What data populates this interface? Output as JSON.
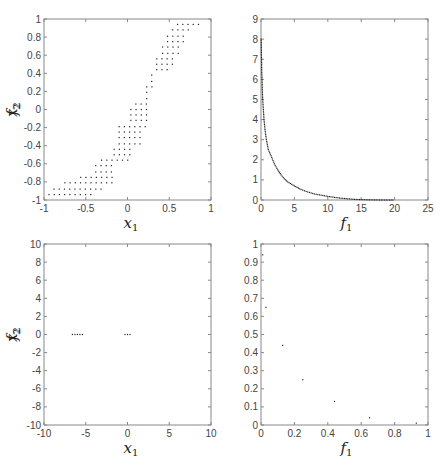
{
  "chart_data": [
    {
      "id": "decision-space-top",
      "type": "scatter",
      "xlabel": "x1",
      "ylabel": "x2",
      "xlim": [
        -1,
        1
      ],
      "ylim": [
        -1,
        1
      ],
      "xticks": [
        -1,
        -0.5,
        0,
        0.5,
        1
      ],
      "yticks": [
        -1,
        -0.8,
        -0.6,
        -0.4,
        -0.2,
        0,
        0.2,
        0.4,
        0.6,
        0.8,
        1
      ],
      "xtick_labels": [
        "-1",
        "-0.5",
        "0",
        "0.5",
        "1"
      ],
      "ytick_labels": [
        "-1",
        "-0.8",
        "-0.6",
        "-0.4",
        "-0.2",
        "0",
        "0.2",
        "0.4",
        "0.6",
        "0.8",
        "1"
      ],
      "grid": false,
      "frame": {
        "x0": 44,
        "y0": 19,
        "x1": 211,
        "y1": 200
      },
      "bands": [
        {
          "y": -0.94,
          "x_from": -0.94,
          "x_to": -0.38
        },
        {
          "y": -0.88,
          "x_from": -0.88,
          "x_to": -0.31
        },
        {
          "y": -0.81,
          "x_from": -0.75,
          "x_to": -0.16
        },
        {
          "y": -0.75,
          "x_from": -0.56,
          "x_to": -0.16
        },
        {
          "y": -0.69,
          "x_from": -0.38,
          "x_to": -0.16
        },
        {
          "y": -0.62,
          "x_from": -0.38,
          "x_to": -0.16
        },
        {
          "y": -0.56,
          "x_from": -0.31,
          "x_to": 0.06
        },
        {
          "y": -0.5,
          "x_from": -0.16,
          "x_to": 0.06
        },
        {
          "y": -0.44,
          "x_from": -0.16,
          "x_to": 0.06
        },
        {
          "y": -0.38,
          "x_from": -0.1,
          "x_to": 0.19
        },
        {
          "y": -0.31,
          "x_from": -0.1,
          "x_to": 0.19
        },
        {
          "y": -0.25,
          "x_from": -0.1,
          "x_to": 0.19
        },
        {
          "y": -0.19,
          "x_from": -0.1,
          "x_to": 0.25
        },
        {
          "y": -0.12,
          "x_from": 0.04,
          "x_to": 0.25
        },
        {
          "y": -0.06,
          "x_from": 0.04,
          "x_to": 0.25
        },
        {
          "y": 0.0,
          "x_from": 0.04,
          "x_to": 0.25
        },
        {
          "y": 0.06,
          "x_from": 0.1,
          "x_to": 0.25
        },
        {
          "y": 0.12,
          "x_from": 0.23,
          "x_to": 0.29
        },
        {
          "y": 0.19,
          "x_from": 0.23,
          "x_to": 0.29
        },
        {
          "y": 0.25,
          "x_from": 0.23,
          "x_to": 0.35
        },
        {
          "y": 0.31,
          "x_from": 0.29,
          "x_to": 0.35
        },
        {
          "y": 0.38,
          "x_from": 0.29,
          "x_to": 0.35
        },
        {
          "y": 0.44,
          "x_from": 0.35,
          "x_to": 0.48
        },
        {
          "y": 0.5,
          "x_from": 0.35,
          "x_to": 0.54
        },
        {
          "y": 0.56,
          "x_from": 0.35,
          "x_to": 0.54
        },
        {
          "y": 0.62,
          "x_from": 0.42,
          "x_to": 0.62
        },
        {
          "y": 0.69,
          "x_from": 0.42,
          "x_to": 0.62
        },
        {
          "y": 0.75,
          "x_from": 0.48,
          "x_to": 0.67
        },
        {
          "y": 0.81,
          "x_from": 0.48,
          "x_to": 0.67
        },
        {
          "y": 0.88,
          "x_from": 0.54,
          "x_to": 0.73
        },
        {
          "y": 0.94,
          "x_from": 0.6,
          "x_to": 0.88
        }
      ],
      "grid_step": 0.0625
    },
    {
      "id": "objective-space-top",
      "type": "scatter",
      "xlabel": "f1",
      "ylabel": "f2",
      "xlim": [
        0,
        25
      ],
      "ylim": [
        0,
        9
      ],
      "xticks": [
        0,
        5,
        10,
        15,
        20,
        25
      ],
      "yticks": [
        0,
        1,
        2,
        3,
        4,
        5,
        6,
        7,
        8,
        9
      ],
      "xtick_labels": [
        "0",
        "5",
        "10",
        "15",
        "20",
        "25"
      ],
      "ytick_labels": [
        "0",
        "1",
        "2",
        "3",
        "4",
        "5",
        "6",
        "7",
        "8",
        "9"
      ],
      "grid": false,
      "frame": {
        "x0": 261,
        "y0": 19,
        "x1": 428,
        "y1": 200
      },
      "curve_description": "dense Pareto front, roughly f2 decreasing from ~8 at f1~0 to ~0 at f1~20",
      "points": [
        [
          0.02,
          8.0
        ],
        [
          0.05,
          7.5
        ],
        [
          0.08,
          7.0
        ],
        [
          0.1,
          6.5
        ],
        [
          0.15,
          6.0
        ],
        [
          0.2,
          5.5
        ],
        [
          0.25,
          5.0
        ],
        [
          0.35,
          4.5
        ],
        [
          0.45,
          4.0
        ],
        [
          0.6,
          3.5
        ],
        [
          0.8,
          3.0
        ],
        [
          1.1,
          2.5
        ],
        [
          1.5,
          2.2
        ],
        [
          2.0,
          1.8
        ],
        [
          2.5,
          1.5
        ],
        [
          3.0,
          1.25
        ],
        [
          3.5,
          1.05
        ],
        [
          4.0,
          0.9
        ],
        [
          5.0,
          0.7
        ],
        [
          6.0,
          0.52
        ],
        [
          7.0,
          0.4
        ],
        [
          8.0,
          0.3
        ],
        [
          9.0,
          0.24
        ],
        [
          10.0,
          0.18
        ],
        [
          11.0,
          0.13
        ],
        [
          12.0,
          0.09
        ],
        [
          13.0,
          0.06
        ],
        [
          14.0,
          0.03
        ],
        [
          15.0,
          0.02
        ],
        [
          16.0,
          0.01
        ],
        [
          18.0,
          0.0
        ],
        [
          20.0,
          0.0
        ]
      ]
    },
    {
      "id": "decision-space-bottom",
      "type": "scatter",
      "xlabel": "x1",
      "ylabel": "x2",
      "xlim": [
        -10,
        10
      ],
      "ylim": [
        -10,
        10
      ],
      "xticks": [
        -10,
        -5,
        0,
        5,
        10
      ],
      "yticks": [
        -10,
        -8,
        -6,
        -4,
        -2,
        0,
        2,
        4,
        6,
        8,
        10
      ],
      "xtick_labels": [
        "-10",
        "-5",
        "0",
        "5",
        "10"
      ],
      "ytick_labels": [
        "-10",
        "-8",
        "-6",
        "-4",
        "-2",
        "0",
        "2",
        "4",
        "6",
        "8",
        "10"
      ],
      "grid": false,
      "frame": {
        "x0": 44,
        "y0": 244,
        "x1": 211,
        "y1": 425
      },
      "points": [
        [
          -6.6,
          0
        ],
        [
          -6.3,
          0
        ],
        [
          -6.0,
          0
        ],
        [
          -5.7,
          0
        ],
        [
          -5.4,
          0
        ],
        [
          -0.3,
          0
        ],
        [
          0.0,
          0
        ],
        [
          0.3,
          0
        ]
      ]
    },
    {
      "id": "objective-space-bottom",
      "type": "scatter",
      "xlabel": "f1",
      "ylabel": "f2",
      "xlim": [
        0,
        1
      ],
      "ylim": [
        0,
        1
      ],
      "xticks": [
        0,
        0.2,
        0.4,
        0.6,
        0.8,
        1
      ],
      "yticks": [
        0,
        0.1,
        0.2,
        0.3,
        0.4,
        0.5,
        0.6,
        0.7,
        0.8,
        0.9,
        1
      ],
      "xtick_labels": [
        "0",
        "0.2",
        "0.4",
        "0.6",
        "0.8",
        "1"
      ],
      "ytick_labels": [
        "0",
        "0.1",
        "0.2",
        "0.3",
        "0.4",
        "0.5",
        "0.6",
        "0.7",
        "0.8",
        "0.9",
        "1"
      ],
      "grid": false,
      "frame": {
        "x0": 261,
        "y0": 244,
        "x1": 428,
        "y1": 425
      },
      "points": [
        [
          0.01,
          0.94
        ],
        [
          0.03,
          0.65
        ],
        [
          0.13,
          0.44
        ],
        [
          0.25,
          0.25
        ],
        [
          0.44,
          0.13
        ],
        [
          0.65,
          0.04
        ],
        [
          0.93,
          0.01
        ]
      ]
    }
  ],
  "labels": {
    "x1_main": "x",
    "x1_sub": "1",
    "x2_main": "x",
    "x2_sub": "2",
    "f1_main": "f",
    "f1_sub": "1",
    "f2_main": "f",
    "f2_sub": "2"
  }
}
